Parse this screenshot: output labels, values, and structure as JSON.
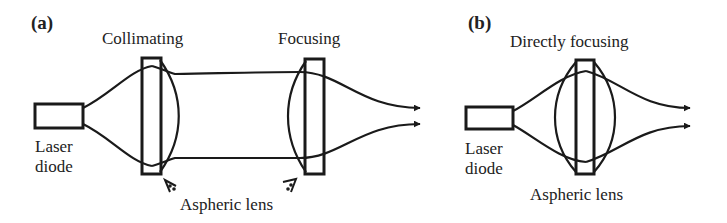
{
  "panels": [
    {
      "id": "a",
      "tag": "(a)",
      "title_left": "Collimating",
      "title_right": "Focusing",
      "source_label_line1": "Laser",
      "source_label_line2": "diode",
      "lens_label": "Aspheric lens"
    },
    {
      "id": "b",
      "tag": "(b)",
      "title": "Directly focusing",
      "source_label_line1": "Laser",
      "source_label_line2": "diode",
      "lens_label": "Aspheric lens"
    }
  ],
  "colors": {
    "stroke": "#1a1a1a",
    "text": "#222222",
    "background": "#ffffff"
  }
}
